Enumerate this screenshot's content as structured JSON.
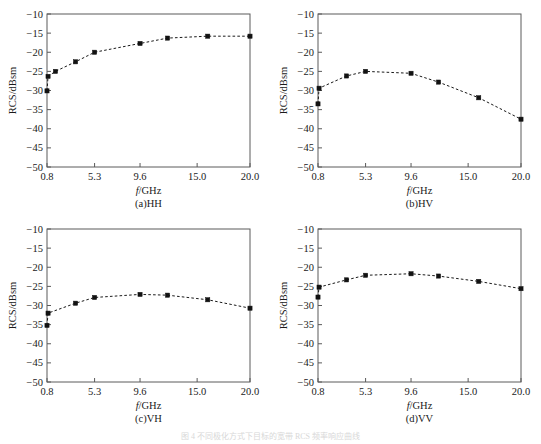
{
  "figure": {
    "caption": "图 4 不同极化方式下目标的宽带 RCS 频率响应曲线"
  },
  "axes": {
    "xlabel_var": "f",
    "xlabel_rest": "/GHz",
    "ylabel": "RCS/dBsm",
    "xticks": [
      "0.8",
      "5.3",
      "9.6",
      "15.0",
      "20.0"
    ],
    "yticks": [
      "−10",
      "−15",
      "−20",
      "−25",
      "−30",
      "−35",
      "−40",
      "−45",
      "−50"
    ],
    "xlim": [
      0.8,
      20.0
    ],
    "ylim": [
      -50,
      -10
    ]
  },
  "chart_data": [
    {
      "type": "line",
      "title": "(a)HH",
      "xlabel": "f/GHz",
      "ylabel": "RCS/dBsm",
      "xlim": [
        0.8,
        20.0
      ],
      "ylim": [
        -50,
        -10
      ],
      "grid": false,
      "legend": "none",
      "x": [
        0.8,
        0.9,
        1.6,
        3.5,
        5.3,
        9.6,
        12.2,
        16.0,
        20.0
      ],
      "y": [
        -30.1,
        -26.3,
        -25.0,
        -22.5,
        -20.0,
        -17.7,
        -16.3,
        -15.8,
        -15.8
      ]
    },
    {
      "type": "line",
      "title": "(b)HV",
      "xlabel": "f/GHz",
      "ylabel": "RCS/dBsm",
      "xlim": [
        0.8,
        20.0
      ],
      "ylim": [
        -50,
        -10
      ],
      "grid": false,
      "legend": "none",
      "x": [
        0.8,
        0.9,
        3.5,
        5.3,
        9.6,
        12.2,
        16.0,
        20.0
      ],
      "y": [
        -33.5,
        -29.4,
        -26.2,
        -25.0,
        -25.5,
        -27.8,
        -31.9,
        -37.5
      ]
    },
    {
      "type": "line",
      "title": "(c)VH",
      "xlabel": "f/GHz",
      "ylabel": "RCS/dBsm",
      "xlim": [
        0.8,
        20.0
      ],
      "ylim": [
        -50,
        -10
      ],
      "grid": false,
      "legend": "none",
      "x": [
        0.8,
        0.9,
        3.5,
        5.3,
        9.6,
        12.2,
        16.0,
        20.0
      ],
      "y": [
        -35.2,
        -32.0,
        -29.4,
        -27.9,
        -27.1,
        -27.3,
        -28.5,
        -30.7
      ]
    },
    {
      "type": "line",
      "title": "(d)VV",
      "xlabel": "f/GHz",
      "ylabel": "RCS/dBsm",
      "xlim": [
        0.8,
        20.0
      ],
      "ylim": [
        -50,
        -10
      ],
      "grid": false,
      "legend": "none",
      "x": [
        0.8,
        0.9,
        3.5,
        5.3,
        9.6,
        12.2,
        16.0,
        20.0
      ],
      "y": [
        -27.8,
        -25.2,
        -23.3,
        -22.1,
        -21.7,
        -22.3,
        -23.7,
        -25.6
      ]
    }
  ]
}
